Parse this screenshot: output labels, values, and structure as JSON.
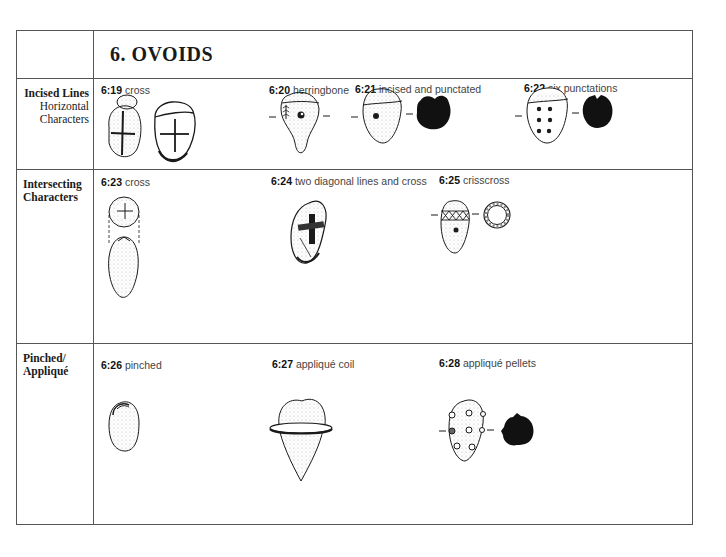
{
  "page": {
    "title": "6. OVOIDS"
  },
  "rows": [
    {
      "label_bold": "Incised Lines",
      "label_sub": [
        "Horizontal",
        "Characters"
      ],
      "items": [
        {
          "num": "6:19",
          "desc": "cross"
        },
        {
          "num": "6:20",
          "desc": "herringbone"
        },
        {
          "num": "6:21",
          "desc": "incised and punctated"
        },
        {
          "num": "6:22",
          "desc": "six punctations"
        }
      ]
    },
    {
      "label_bold": "Intersecting Characters",
      "items": [
        {
          "num": "6:23",
          "desc": "cross"
        },
        {
          "num": "6:24",
          "desc": "two diagonal lines and cross"
        },
        {
          "num": "6:25",
          "desc": "crisscross"
        }
      ]
    },
    {
      "label_bold": "Pinched/ Appliqué",
      "items": [
        {
          "num": "6:26",
          "desc": "pinched"
        },
        {
          "num": "6:27",
          "desc": "appliqué coil"
        },
        {
          "num": "6:28",
          "desc": "appliqué pellets"
        }
      ]
    }
  ],
  "colors": {
    "ink": "#1a1a1a",
    "stipple": "#bdbdbd",
    "rule": "#555555"
  }
}
